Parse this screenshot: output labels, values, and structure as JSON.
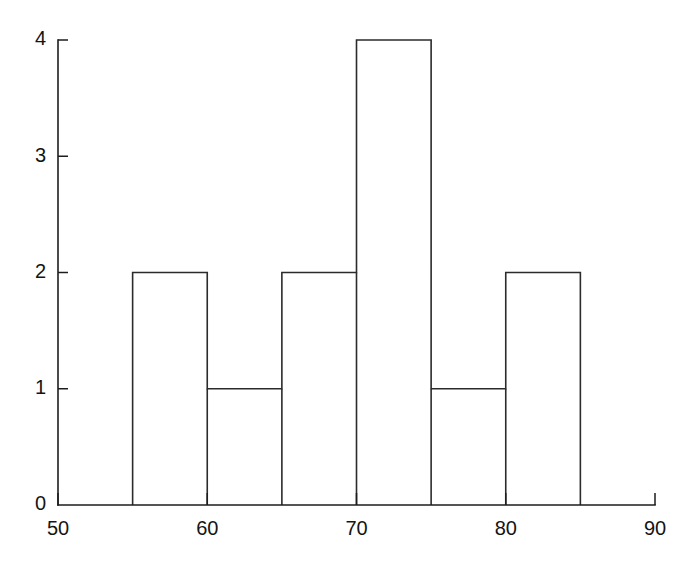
{
  "figure": {
    "background_color": "#ffffff",
    "line_color": "#2b2b2b",
    "text_color": "#141414",
    "width": 684,
    "height": 567
  },
  "chart_data": {
    "type": "bar",
    "subtype": "histogram",
    "title": "",
    "subtitle": "",
    "xlabel": "",
    "ylabel": "",
    "xlim": [
      50,
      90
    ],
    "ylim": [
      0,
      4
    ],
    "bin_width": 5,
    "grid": false,
    "legend": null,
    "categories": [
      "55-60",
      "60-65",
      "65-70",
      "70-75",
      "75-80",
      "80-85"
    ],
    "bin_edges": [
      55,
      60,
      65,
      70,
      75,
      80,
      85
    ],
    "values": [
      2,
      1,
      2,
      4,
      1,
      2
    ],
    "bars": [
      {
        "label": "55-60",
        "x0": 55,
        "x1": 60,
        "value": 2
      },
      {
        "label": "60-65",
        "x0": 60,
        "x1": 65,
        "value": 1
      },
      {
        "label": "65-70",
        "x0": 65,
        "x1": 70,
        "value": 2
      },
      {
        "label": "70-75",
        "x0": 70,
        "x1": 75,
        "value": 4
      },
      {
        "label": "75-80",
        "x0": 75,
        "x1": 80,
        "value": 1
      },
      {
        "label": "80-85",
        "x0": 80,
        "x1": 85,
        "value": 2
      }
    ],
    "xticks": [
      50,
      60,
      70,
      80,
      90
    ],
    "xtick_labels": [
      "50",
      "60",
      "70",
      "80",
      "90"
    ],
    "yticks": [
      0,
      1,
      2,
      3,
      4
    ],
    "ytick_labels": [
      "0",
      "1",
      "2",
      "3",
      "4"
    ]
  }
}
